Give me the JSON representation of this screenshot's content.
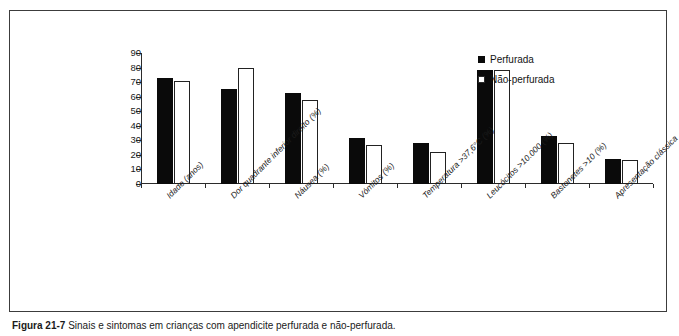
{
  "figure": {
    "caption_label": "Figura 21-7",
    "caption_text": "Sinais e sintomas em crianças com apendicite perfurada e não-perfurada."
  },
  "legend": {
    "position": "top-right",
    "items": [
      {
        "label": "Perfurada",
        "swatch": "filled-square-icon",
        "color": "#0a0a0a"
      },
      {
        "label": "Não-perfurada",
        "swatch": "hollow-square-icon",
        "color": "#ffffff"
      }
    ]
  },
  "chart_data": {
    "type": "bar",
    "title": "",
    "subtitle": "",
    "xlabel": "",
    "ylabel": "",
    "ylim": [
      0,
      90
    ],
    "ytick_step": 10,
    "grid": false,
    "legend_position": "top-right",
    "categories": [
      "Idade (anos)",
      "Dor quadrante inferior direito (%)",
      "Náusea (%)",
      "Vómitos (%)",
      "Temperatura >37,6°C (%)",
      "Leucócitos >10.000 (%)",
      "Bastonetes >10 (%)",
      "Apresentação clássica"
    ],
    "yticks": [
      0,
      10,
      20,
      30,
      40,
      50,
      60,
      70,
      80,
      90
    ],
    "series": [
      {
        "name": "Perfurada",
        "color": "#0a0a0a",
        "style": "filled",
        "values": [
          72.5,
          65.5,
          62.5,
          31.5,
          28,
          78.5,
          33,
          17
        ]
      },
      {
        "name": "Não-perfurada",
        "color": "#ffffff",
        "style": "hollow",
        "values": [
          71,
          80,
          58,
          26.5,
          22,
          78.5,
          28.5,
          16.5
        ]
      }
    ]
  }
}
